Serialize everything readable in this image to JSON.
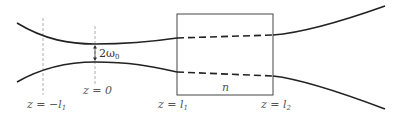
{
  "diagram": {
    "labels": {
      "z_minus_l1": "z = −l",
      "z_minus_l1_sub": "1",
      "z_zero": "z = 0",
      "z_l1": "z = l",
      "z_l1_sub": "1",
      "z_l2": "z = l",
      "z_l2_sub": "2",
      "waist": "2ω",
      "waist_sub": "0",
      "index": "n"
    },
    "elements": {
      "slab": {
        "x1": 177,
        "x2": 273,
        "y1": 14,
        "y2": 95
      },
      "beam_waist_position": "z = 0",
      "reference_lines": [
        "z = −l1",
        "z = 0"
      ],
      "inside_slab_style": "dashed",
      "outside_slab_style": "solid"
    },
    "colors": {
      "line": "#222222",
      "box": "#444444",
      "guide": "#999999",
      "text": "#555555"
    }
  }
}
